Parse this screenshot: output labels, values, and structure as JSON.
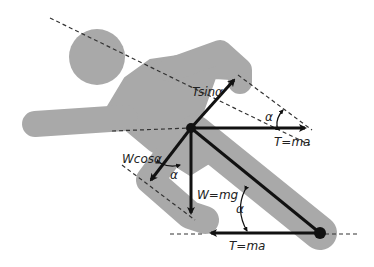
{
  "diagram": {
    "colors": {
      "figure": "#a9a9a9",
      "arrow": "#111111",
      "dashed": "#333333",
      "background": "#ffffff"
    },
    "labels": {
      "t_sin": "Tsinα",
      "t_ma_upper": "T=ma",
      "w_cos": "Wcosα",
      "w_mg": "W=mg",
      "t_ma_lower": "T=ma",
      "alpha_upper": "α",
      "alpha_left": "α",
      "alpha_lower": "α"
    },
    "points": {
      "center_of_mass": [
        191,
        128
      ],
      "foot_contact": [
        320,
        233
      ]
    }
  }
}
